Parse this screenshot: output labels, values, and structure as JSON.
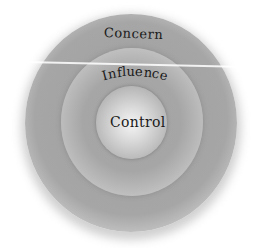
{
  "diagram": {
    "type": "concentric-circles",
    "circles": [
      {
        "id": "outer",
        "label": "Concern"
      },
      {
        "id": "middle",
        "label": "Influence"
      },
      {
        "id": "inner",
        "label": "Control"
      }
    ],
    "colors": {
      "ring_dark": "#a4a4a4",
      "ring_light": "#cbcbcb",
      "center_highlight": "#f4f4f4",
      "text": "#1a1a1a",
      "background": "#ffffff"
    }
  },
  "influence_letters": [
    "I",
    "n",
    "f",
    "l",
    "u",
    "e",
    "n",
    "c",
    "e"
  ]
}
